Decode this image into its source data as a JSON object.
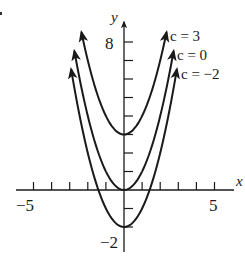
{
  "chart_data": {
    "type": "line",
    "title": "",
    "xlabel": "x",
    "ylabel": "y",
    "xlim": [
      -5.5,
      6
    ],
    "ylim": [
      -3.2,
      9.5
    ],
    "grid": false,
    "x_tick_labels": [
      {
        "value": -5,
        "label": "-5"
      },
      {
        "value": 5,
        "label": "5"
      }
    ],
    "y_tick_labels": [
      {
        "value": 8,
        "label": "8"
      },
      {
        "value": -2,
        "label": "-2"
      }
    ],
    "x_ticks": [
      -5,
      -4,
      -3,
      -2,
      -1,
      1,
      2,
      3,
      4,
      5
    ],
    "y_ticks": [
      -1,
      -2,
      1,
      2,
      3,
      4,
      5,
      6,
      7,
      8
    ],
    "series": [
      {
        "name": "c = 3",
        "c": 3,
        "equation": "y = x^2 + c",
        "x": [
          -2.35,
          -2,
          -1,
          0,
          1,
          2,
          2.35
        ],
        "y": [
          8.5,
          7,
          4,
          3,
          4,
          7,
          8.5
        ]
      },
      {
        "name": "c = 0",
        "c": 0,
        "equation": "y = x^2 + c",
        "x": [
          -2.74,
          -2,
          -1,
          0,
          1,
          2,
          2.74
        ],
        "y": [
          7.5,
          4,
          1,
          0,
          1,
          4,
          7.5
        ]
      },
      {
        "name": "c = -2",
        "c": -2,
        "equation": "y = x^2 + c",
        "x": [
          -2.92,
          -2,
          -1,
          0,
          1,
          2,
          2.92
        ],
        "y": [
          6.5,
          2,
          -1,
          -2,
          -1,
          2,
          6.5
        ]
      }
    ],
    "annotations": [
      "c = 3",
      "c = 0",
      "c = −2"
    ],
    "legend_position": "inline-right"
  },
  "labels": {
    "x_axis": "x",
    "y_axis": "y",
    "x_min_tick": "−5",
    "x_max_tick": "5",
    "y_max_tick": "8",
    "y_min_tick": "−2",
    "series_c3": "c = 3",
    "series_c0": "c = 0",
    "series_cm2": "c = −2"
  }
}
